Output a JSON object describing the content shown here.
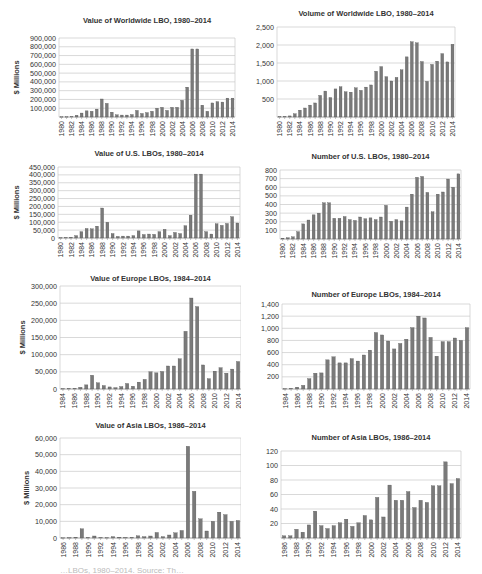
{
  "chart_data": [
    {
      "id": "ww-value",
      "type": "bar",
      "title": "Value of Worldwide LBO, 1980–2014",
      "xlabel": "",
      "ylabel": "$ Millions",
      "ylim": [
        0,
        900000
      ],
      "yticks": [
        100000,
        200000,
        300000,
        400000,
        500000,
        600000,
        700000,
        800000,
        900000
      ],
      "ytick_labels": [
        "100,000",
        "200,000",
        "300,000",
        "400,000",
        "500,000",
        "600,000",
        "700,000",
        "800,000",
        "900,000"
      ],
      "show_zero_label": false,
      "grid": true,
      "legend": "none",
      "categories": [
        1980,
        1981,
        1982,
        1983,
        1984,
        1985,
        1986,
        1987,
        1988,
        1989,
        1990,
        1991,
        1992,
        1993,
        1994,
        1995,
        1996,
        1997,
        1998,
        1999,
        2000,
        2001,
        2002,
        2003,
        2004,
        2005,
        2006,
        2007,
        2008,
        2009,
        2010,
        2011,
        2012,
        2013,
        2014
      ],
      "xtick_labels": [
        "1980",
        "",
        "1982",
        "",
        "1984",
        "",
        "1986",
        "",
        "1988",
        "",
        "1990",
        "",
        "1992",
        "",
        "1994",
        "",
        "1996",
        "",
        "1998",
        "",
        "2000",
        "",
        "2002",
        "",
        "2004",
        "",
        "2006",
        "",
        "2008",
        "",
        "2010",
        "",
        "2012",
        "",
        "2014"
      ],
      "values": [
        2000,
        3000,
        5000,
        20000,
        45000,
        70000,
        65000,
        90000,
        205000,
        155000,
        55000,
        25000,
        22000,
        22000,
        28000,
        75000,
        40000,
        50000,
        65000,
        100000,
        110000,
        75000,
        110000,
        110000,
        190000,
        340000,
        775000,
        775000,
        135000,
        65000,
        160000,
        175000,
        170000,
        215000,
        215000
      ],
      "layout": {
        "x": 0,
        "y": 10,
        "w": 241,
        "h": 130,
        "plot": [
          59,
          28,
          176,
          79
        ],
        "title_y": 13,
        "ylabel_x": 14
      }
    },
    {
      "id": "ww-volume",
      "type": "bar",
      "title": "Volume of Worldwide LBO, 1980–2014",
      "xlabel": "",
      "ylabel": "",
      "ylim": [
        0,
        2500
      ],
      "yticks": [
        500,
        1000,
        1500,
        2000,
        2500
      ],
      "ytick_labels": [
        "500",
        "1,000",
        "1,500",
        "2,000",
        "2,500"
      ],
      "show_zero_label": false,
      "grid": true,
      "legend": "none",
      "categories": [
        1980,
        1981,
        1982,
        1983,
        1984,
        1985,
        1986,
        1987,
        1988,
        1989,
        1990,
        1991,
        1992,
        1993,
        1994,
        1995,
        1996,
        1997,
        1998,
        1999,
        2000,
        2001,
        2002,
        2003,
        2004,
        2005,
        2006,
        2007,
        2008,
        2009,
        2010,
        2011,
        2012,
        2013,
        2014
      ],
      "xtick_labels": [
        "1980",
        "",
        "1982",
        "",
        "1984",
        "",
        "1986",
        "",
        "1988",
        "",
        "1990",
        "",
        "1992",
        "",
        "1994",
        "",
        "1996",
        "",
        "1998",
        "",
        "2000",
        "",
        "2002",
        "",
        "2004",
        "",
        "2006",
        "",
        "2008",
        "",
        "2010",
        "",
        "2012",
        "",
        "2014"
      ],
      "values": [
        10,
        15,
        30,
        90,
        190,
        250,
        330,
        390,
        600,
        720,
        540,
        780,
        840,
        700,
        690,
        810,
        740,
        830,
        890,
        1270,
        1400,
        1120,
        1000,
        1100,
        1310,
        1670,
        2090,
        2060,
        1540,
        990,
        1460,
        1550,
        1760,
        1530,
        2020
      ],
      "layout": {
        "x": 241,
        "y": 0,
        "w": 241,
        "h": 140,
        "plot": [
          36,
          27,
          178,
          90
        ],
        "title_y": 16,
        "ylabel_x": 0
      }
    },
    {
      "id": "us-value",
      "type": "bar",
      "title": "Value of U.S. LBOs, 1980–2014",
      "xlabel": "",
      "ylabel": "$ Millions",
      "ylim": [
        0,
        450000
      ],
      "yticks": [
        0,
        50000,
        100000,
        150000,
        200000,
        250000,
        300000,
        350000,
        400000,
        450000
      ],
      "ytick_labels": [
        "0",
        "50,000",
        "100,000",
        "150,000",
        "200,000",
        "250,000",
        "300,000",
        "350,000",
        "400,000",
        "450,000"
      ],
      "show_zero_label": true,
      "grid": true,
      "legend": "none",
      "categories": [
        1980,
        1981,
        1982,
        1983,
        1984,
        1985,
        1986,
        1987,
        1988,
        1989,
        1990,
        1991,
        1992,
        1993,
        1994,
        1995,
        1996,
        1997,
        1998,
        1999,
        2000,
        2001,
        2002,
        2003,
        2004,
        2005,
        2006,
        2007,
        2008,
        2009,
        2010,
        2011,
        2012,
        2013,
        2014
      ],
      "xtick_labels": [
        "1980",
        "",
        "1982",
        "",
        "1984",
        "",
        "1986",
        "",
        "1988",
        "",
        "1990",
        "",
        "1992",
        "",
        "1994",
        "",
        "1996",
        "",
        "1998",
        "",
        "2000",
        "",
        "2002",
        "",
        "2004",
        "",
        "2006",
        "",
        "2008",
        "",
        "2010",
        "",
        "2012",
        "",
        "2014"
      ],
      "values": [
        2000,
        3000,
        5000,
        15000,
        40000,
        60000,
        58000,
        75000,
        190000,
        100000,
        28000,
        10000,
        12000,
        12000,
        15000,
        45000,
        22000,
        25000,
        23000,
        40000,
        55000,
        15000,
        35000,
        28000,
        78000,
        145000,
        405000,
        405000,
        40000,
        25000,
        90000,
        80000,
        92000,
        135000,
        95000
      ],
      "layout": {
        "x": 0,
        "y": 140,
        "w": 241,
        "h": 130,
        "plot": [
          58,
          27,
          182,
          71
        ],
        "title_y": 16,
        "ylabel_x": 14
      }
    },
    {
      "id": "us-number",
      "type": "bar",
      "title": "Number of U.S. LBOs, 1980–2014",
      "xlabel": "",
      "ylabel": "",
      "ylim": [
        0,
        800
      ],
      "yticks": [
        100,
        200,
        300,
        400,
        500,
        600,
        700,
        800
      ],
      "ytick_labels": [
        "100",
        "200",
        "300",
        "400",
        "500",
        "600",
        "700",
        "800"
      ],
      "show_zero_label": false,
      "grid": true,
      "legend": "none",
      "categories": [
        1980,
        1981,
        1982,
        1983,
        1984,
        1985,
        1986,
        1987,
        1988,
        1989,
        1990,
        1991,
        1992,
        1993,
        1994,
        1995,
        1996,
        1997,
        1998,
        1999,
        2000,
        2001,
        2002,
        2003,
        2004,
        2005,
        2006,
        2007,
        2008,
        2009,
        2010,
        2011,
        2012,
        2013,
        2014
      ],
      "xtick_labels": [
        "1980",
        "",
        "1982",
        "",
        "1984",
        "",
        "1986",
        "",
        "1988",
        "",
        "1990",
        "",
        "1992",
        "",
        "1994",
        "",
        "1996",
        "",
        "1998",
        "",
        "2000",
        "",
        "2002",
        "",
        "2004",
        "",
        "2006",
        "",
        "2008",
        "",
        "2010",
        "",
        "2012",
        "",
        "2014"
      ],
      "values": [
        10,
        15,
        25,
        85,
        175,
        220,
        280,
        300,
        420,
        420,
        240,
        240,
        260,
        225,
        215,
        255,
        235,
        245,
        225,
        255,
        390,
        205,
        225,
        210,
        370,
        520,
        715,
        725,
        540,
        315,
        520,
        545,
        695,
        600,
        755
      ],
      "layout": {
        "x": 241,
        "y": 140,
        "w": 241,
        "h": 130,
        "plot": [
          39,
          30,
          181,
          69
        ],
        "title_y": 19,
        "ylabel_x": 0
      }
    },
    {
      "id": "eu-value",
      "type": "bar",
      "title": "Value of Europe LBOs, 1984–2014",
      "xlabel": "",
      "ylabel": "$ Millions",
      "ylim": [
        0,
        300000
      ],
      "yticks": [
        0,
        50000,
        100000,
        150000,
        200000,
        250000,
        300000
      ],
      "ytick_labels": [
        "0",
        "50,000",
        "100,000",
        "150,000",
        "200,000",
        "250,000",
        "300,000"
      ],
      "show_zero_label": true,
      "grid": true,
      "legend": "none",
      "categories": [
        1984,
        1985,
        1986,
        1987,
        1988,
        1989,
        1990,
        1991,
        1992,
        1993,
        1994,
        1995,
        1996,
        1997,
        1998,
        1999,
        2000,
        2001,
        2002,
        2003,
        2004,
        2005,
        2006,
        2007,
        2008,
        2009,
        2010,
        2011,
        2012,
        2013,
        2014
      ],
      "xtick_labels": [
        "1984",
        "",
        "1986",
        "",
        "1988",
        "",
        "1990",
        "",
        "1992",
        "",
        "1994",
        "",
        "1996",
        "",
        "1998",
        "",
        "2000",
        "",
        "2002",
        "",
        "2004",
        "",
        "2006",
        "",
        "2008",
        "",
        "2010",
        "",
        "2012",
        "",
        "2014"
      ],
      "values": [
        1000,
        1500,
        2000,
        5000,
        12000,
        40000,
        18000,
        10000,
        6000,
        4000,
        7000,
        16000,
        8000,
        20000,
        28000,
        50000,
        47000,
        51000,
        67000,
        67000,
        88000,
        168000,
        265000,
        240000,
        70000,
        30000,
        52000,
        62000,
        46000,
        58000,
        80000
      ],
      "layout": {
        "x": 0,
        "y": 270,
        "w": 241,
        "h": 145,
        "plot": [
          60,
          16,
          181,
          103
        ],
        "title_y": 11,
        "ylabel_x": 20
      }
    },
    {
      "id": "eu-number",
      "type": "bar",
      "title": "Number of Europe LBOs, 1984–2014",
      "xlabel": "",
      "ylabel": "",
      "ylim": [
        0,
        1400
      ],
      "yticks": [
        200,
        400,
        600,
        800,
        1000,
        1200,
        1400
      ],
      "ytick_labels": [
        "200",
        "400",
        "600",
        "800",
        "1,000",
        "1,200",
        "1,400"
      ],
      "show_zero_label": false,
      "grid": true,
      "legend": "none",
      "categories": [
        1984,
        1985,
        1986,
        1987,
        1988,
        1989,
        1990,
        1991,
        1992,
        1993,
        1994,
        1995,
        1996,
        1997,
        1998,
        1999,
        2000,
        2001,
        2002,
        2003,
        2004,
        2005,
        2006,
        2007,
        2008,
        2009,
        2010,
        2011,
        2012,
        2013,
        2014
      ],
      "xtick_labels": [
        "1984",
        "",
        "1986",
        "",
        "1988",
        "",
        "1990",
        "",
        "1992",
        "",
        "1994",
        "",
        "1996",
        "",
        "1998",
        "",
        "2000",
        "",
        "2002",
        "",
        "2004",
        "",
        "2006",
        "",
        "2008",
        "",
        "2010",
        "",
        "2012",
        "",
        "2014"
      ],
      "values": [
        5,
        10,
        30,
        60,
        170,
        260,
        265,
        480,
        530,
        430,
        430,
        500,
        460,
        560,
        640,
        930,
        890,
        790,
        660,
        750,
        820,
        1010,
        1200,
        1170,
        850,
        540,
        780,
        780,
        840,
        800,
        1010
      ],
      "layout": {
        "x": 241,
        "y": 270,
        "w": 241,
        "h": 145,
        "plot": [
          41,
          34,
          188,
          85
        ],
        "title_y": 27,
        "ylabel_x": 0
      }
    },
    {
      "id": "asia-value",
      "type": "bar",
      "title": "Value of Asia LBOs, 1986–2014",
      "xlabel": "",
      "ylabel": "$ Millions",
      "ylim": [
        0,
        60000
      ],
      "yticks": [
        0,
        10000,
        20000,
        30000,
        40000,
        50000,
        60000
      ],
      "ytick_labels": [
        "0",
        "10,000",
        "20,000",
        "30,000",
        "40,000",
        "50,000",
        "60,000"
      ],
      "show_zero_label": true,
      "grid": true,
      "legend": "none",
      "categories": [
        1986,
        1987,
        1988,
        1989,
        1990,
        1991,
        1992,
        1993,
        1994,
        1995,
        1996,
        1997,
        1998,
        1999,
        2000,
        2001,
        2002,
        2003,
        2004,
        2005,
        2006,
        2007,
        2008,
        2009,
        2010,
        2011,
        2012,
        2013,
        2014
      ],
      "xtick_labels": [
        "1986",
        "",
        "1988",
        "",
        "1990",
        "",
        "1992",
        "",
        "1994",
        "",
        "1996",
        "",
        "1998",
        "",
        "2000",
        "",
        "2002",
        "",
        "2004",
        "",
        "2006",
        "",
        "2008",
        "",
        "2010",
        "",
        "2012",
        "",
        "2014"
      ],
      "values": [
        100,
        200,
        500,
        5500,
        300,
        1200,
        300,
        200,
        800,
        500,
        300,
        400,
        1300,
        800,
        1200,
        3300,
        800,
        1800,
        3100,
        4500,
        55000,
        28000,
        11500,
        4200,
        10000,
        15500,
        14000,
        10000,
        10500
      ],
      "layout": {
        "x": 0,
        "y": 415,
        "w": 241,
        "h": 150,
        "plot": [
          60,
          23,
          181,
          100
        ],
        "title_y": 13,
        "ylabel_x": 24
      }
    },
    {
      "id": "asia-number",
      "type": "bar",
      "title": "Number of Asia LBOs, 1986–2014",
      "xlabel": "",
      "ylabel": "",
      "ylim": [
        0,
        120
      ],
      "yticks": [
        20,
        40,
        60,
        80,
        100,
        120
      ],
      "ytick_labels": [
        "20",
        "40",
        "60",
        "80",
        "100",
        "120"
      ],
      "show_zero_label": false,
      "grid": true,
      "legend": "none",
      "categories": [
        1986,
        1987,
        1988,
        1989,
        1990,
        1991,
        1992,
        1993,
        1994,
        1995,
        1996,
        1997,
        1998,
        1999,
        2000,
        2001,
        2002,
        2003,
        2004,
        2005,
        2006,
        2007,
        2008,
        2009,
        2010,
        2011,
        2012,
        2013,
        2014
      ],
      "xtick_labels": [
        "1986",
        "",
        "1988",
        "",
        "1990",
        "",
        "1992",
        "",
        "1994",
        "",
        "1996",
        "",
        "1998",
        "",
        "2000",
        "",
        "2002",
        "",
        "2004",
        "",
        "2006",
        "",
        "2008",
        "",
        "2010",
        "",
        "2012",
        "",
        "2014"
      ],
      "values": [
        3,
        3,
        12,
        8,
        18,
        37,
        17,
        13,
        17,
        21,
        26,
        16,
        21,
        31,
        25,
        56,
        29,
        73,
        52,
        52,
        64,
        42,
        52,
        49,
        72,
        72,
        105,
        75,
        82
      ],
      "layout": {
        "x": 241,
        "y": 415,
        "w": 241,
        "h": 150,
        "plot": [
          40,
          36,
          180,
          87
        ],
        "title_y": 25,
        "ylabel_x": 0
      }
    }
  ],
  "style": {
    "bar_color": "#7a7a7a",
    "bar_stroke": "#4a4a4a",
    "grid_color": "#c8c8c8",
    "axis_color": "#9a9a9a",
    "text_color": "#333333"
  },
  "caption_fragment": "…LBOs, 1980–2014. Source: Th…"
}
